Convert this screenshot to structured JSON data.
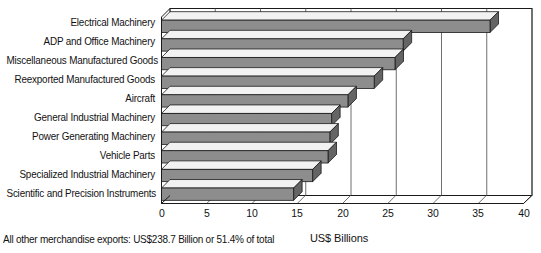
{
  "chart_data": {
    "type": "bar",
    "orientation": "horizontal",
    "title": "",
    "subtitle": "",
    "xlabel": "US$ Billions",
    "ylabel": "",
    "xlim": [
      0,
      40
    ],
    "xticks": [
      0,
      5,
      10,
      15,
      20,
      25,
      30,
      35,
      40
    ],
    "xtick_labels": [
      "0",
      "5",
      "10",
      "15",
      "20",
      "25",
      "30",
      "35",
      "40"
    ],
    "grid": "vertical",
    "legend": "none",
    "style": "3d-bars-gray",
    "categories": [
      "Electrical Machinery",
      "ADP and Office Machinery",
      "Miscellaneous Manufactured Goods",
      "Reexported Manufactured Goods",
      "Aircraft",
      "General Industrial Machinery",
      "Power Generating Machinery",
      "Vehicle Parts",
      "Specialized Industrial Machinery",
      "Scientific and Precision Instruments"
    ],
    "values": [
      36.3,
      26.7,
      25.8,
      23.5,
      20.6,
      18.8,
      18.6,
      18.4,
      16.7,
      14.6
    ],
    "annotations": [
      "All other merchandise exports: US$238.7 Billion or 51.4% of total"
    ]
  },
  "footnote": {
    "text": "All other merchandise exports: US$238.7 Billion or 51.4% of total"
  },
  "axis": {
    "x_title": "US$ Billions"
  },
  "colors": {
    "bar_face": "#8d8d8d",
    "bar_top": "#f2f2f2",
    "bar_side": "#646464",
    "outline": "#1a1a1a",
    "grid": "#4a4a4a",
    "background": "#ffffff",
    "text": "#121212"
  }
}
